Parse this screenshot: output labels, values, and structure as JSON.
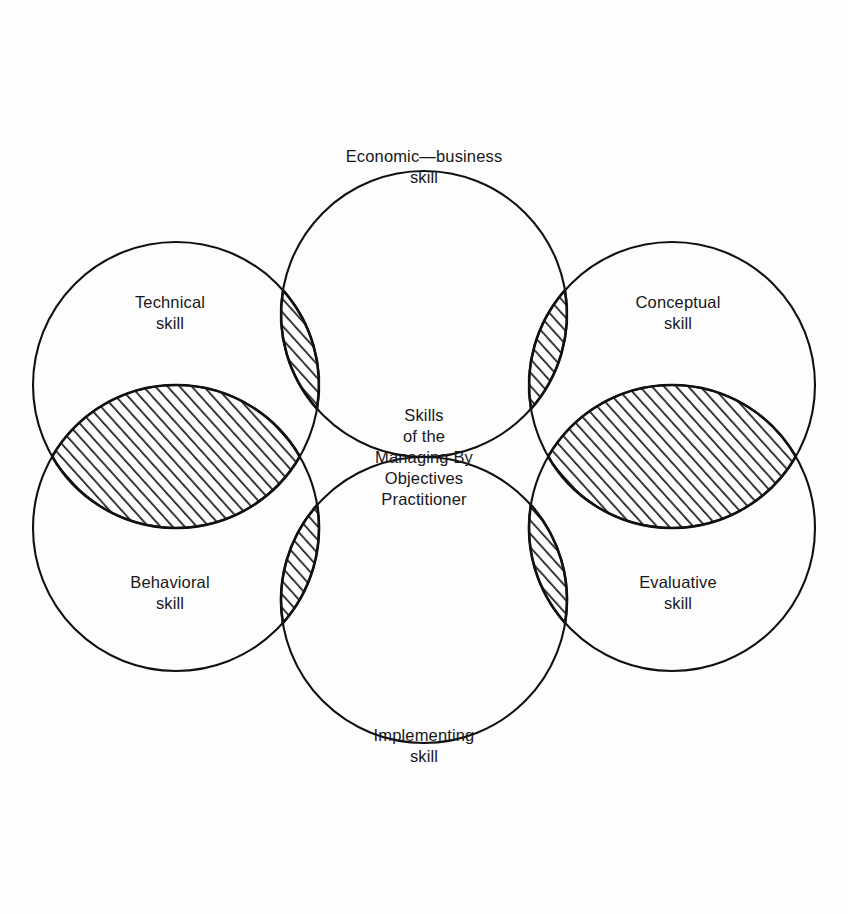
{
  "diagram": {
    "type": "venn",
    "background_color": "#fdfdfd",
    "stroke_color": "#111111",
    "text_color": "#18181a",
    "hatch_color": "#1a1a1a",
    "center": {
      "lines": [
        "Skills",
        "of the",
        "Managing By",
        "Objectives",
        "Practitioner"
      ]
    },
    "circles": [
      {
        "id": "economic-business",
        "label_lines": [
          "Economic—business",
          "skill"
        ],
        "position": "top",
        "cx": 424,
        "cy": 314,
        "r": 143,
        "label_x": 424,
        "label_y": 162
      },
      {
        "id": "conceptual",
        "label_lines": [
          "Conceptual",
          "skill"
        ],
        "position": "top-right",
        "cx": 672,
        "cy": 385,
        "r": 143,
        "label_x": 678,
        "label_y": 308
      },
      {
        "id": "evaluative",
        "label_lines": [
          "Evaluative",
          "skill"
        ],
        "position": "bottom-right",
        "cx": 672,
        "cy": 528,
        "r": 143,
        "label_x": 678,
        "label_y": 588
      },
      {
        "id": "implementing",
        "label_lines": [
          "Implementing",
          "skill"
        ],
        "position": "bottom",
        "cx": 424,
        "cy": 600,
        "r": 143,
        "label_x": 424,
        "label_y": 741
      },
      {
        "id": "behavioral",
        "label_lines": [
          "Behavioral",
          "skill"
        ],
        "position": "bottom-left",
        "cx": 176,
        "cy": 528,
        "r": 143,
        "label_x": 170,
        "label_y": 588
      },
      {
        "id": "technical",
        "label_lines": [
          "Technical",
          "skill"
        ],
        "position": "top-left",
        "cx": 176,
        "cy": 385,
        "r": 143,
        "label_x": 170,
        "label_y": 308
      }
    ],
    "intersections": [
      {
        "id": "technical-economic",
        "between": [
          "technical",
          "economic-business"
        ],
        "hatched": true
      },
      {
        "id": "economic-conceptual",
        "between": [
          "economic-business",
          "conceptual"
        ],
        "hatched": true
      },
      {
        "id": "conceptual-evaluative",
        "between": [
          "conceptual",
          "evaluative"
        ],
        "hatched": true
      },
      {
        "id": "evaluative-implementing",
        "between": [
          "evaluative",
          "implementing"
        ],
        "hatched": true
      },
      {
        "id": "implementing-behavioral",
        "between": [
          "implementing",
          "behavioral"
        ],
        "hatched": true
      },
      {
        "id": "behavioral-technical",
        "between": [
          "behavioral",
          "technical"
        ],
        "hatched": true
      }
    ]
  }
}
